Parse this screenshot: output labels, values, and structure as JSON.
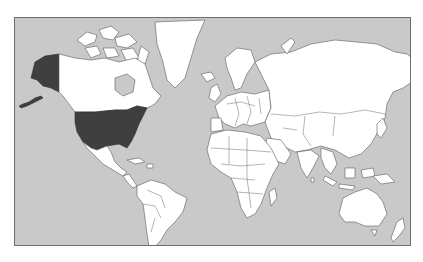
{
  "map": {
    "title": "World map",
    "projection": "Mercator",
    "highlighted_country": "United States of America",
    "highlighted_regions": [
      "Contiguous United States",
      "Alaska"
    ],
    "colors": {
      "ocean": "#c9c9c9",
      "land": "#ffffff",
      "highlight": "#3f3f3f",
      "border": "#5a5a5a"
    }
  }
}
